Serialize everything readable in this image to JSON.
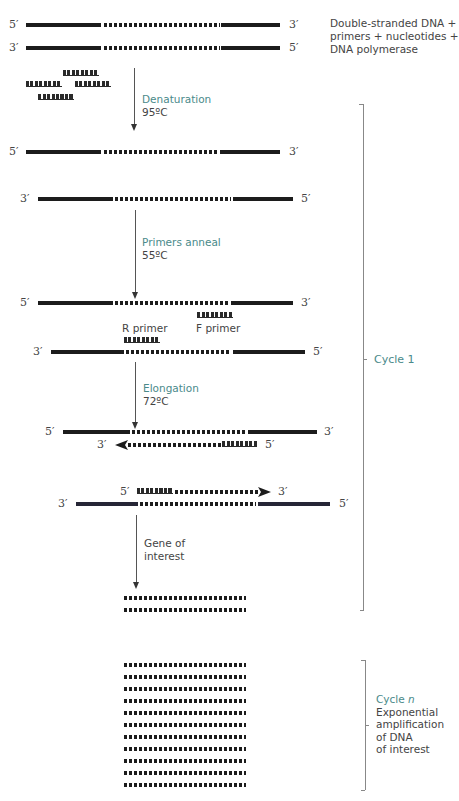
{
  "diagram": {
    "start_label": [
      "Double-stranded DNA +",
      "primers + nucleotides +",
      "DNA polymerase"
    ],
    "prime5": "5′",
    "prime3": "3′",
    "steps": [
      {
        "name": "Denaturation",
        "temp": "95ºC"
      },
      {
        "name": "Primers anneal",
        "temp": "55ºC"
      },
      {
        "name": "Elongation",
        "temp": "72ºC"
      }
    ],
    "primer_labels": {
      "reverse": "R primer",
      "forward": "F primer"
    },
    "gene_label": [
      "Gene of",
      "interest"
    ],
    "cycle1": {
      "label": "Cycle 1"
    },
    "cyclen": {
      "label_prefix": "Cycle ",
      "label_n": "n",
      "description": [
        "Exponential",
        "amplification",
        "of DNA",
        "of interest"
      ]
    },
    "amplified_copies_count": 11,
    "colors": {
      "accent_teal": "#4a8a8a",
      "strand": "#1c1c1c",
      "text": "#444444",
      "bracket": "#888888"
    }
  }
}
